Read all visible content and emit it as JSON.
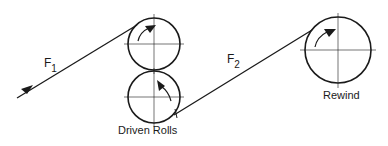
{
  "diagram": {
    "type": "web-tension-roll-schematic",
    "labels": {
      "f1_main": "F",
      "f1_sub": "1",
      "f2_main": "F",
      "f2_sub": "2",
      "driven_rolls": "Driven Rolls",
      "rewind": "Rewind"
    },
    "colors": {
      "line": "#1a1a1a",
      "background": "#ffffff"
    },
    "rolls": [
      {
        "name": "driven-roll-top",
        "cx": 154,
        "cy": 44,
        "r": 26,
        "rotation": "clockwise"
      },
      {
        "name": "driven-roll-bottom",
        "cx": 154,
        "cy": 97,
        "r": 26,
        "rotation": "counterclockwise"
      },
      {
        "name": "rewind-roll",
        "cx": 338,
        "cy": 50,
        "r": 33,
        "rotation": "clockwise"
      }
    ],
    "web_segments": [
      {
        "name": "web-f1",
        "from": [
          17,
          98
        ],
        "to": [
          136,
          25
        ],
        "label": "F1"
      },
      {
        "name": "web-f2",
        "from": [
          174,
          115
        ],
        "to": [
          311,
          30
        ],
        "label": "F2"
      }
    ]
  }
}
